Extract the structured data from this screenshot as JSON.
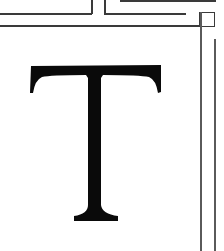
{
  "glyph": {
    "character": "T",
    "color": "#0a0a0a",
    "style": "serif capital letter"
  },
  "frame": {
    "line_color": "#3a3a3a",
    "background": "#ffffff"
  }
}
